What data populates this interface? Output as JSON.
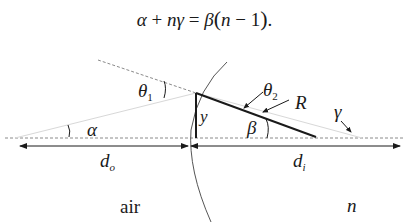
{
  "equation": {
    "text": "α + nγ = β(n − 1).",
    "parts": {
      "alpha": "α",
      "plus": " + ",
      "n1": "n",
      "gamma": "γ",
      "equals": " = ",
      "beta": "β",
      "open": "(",
      "n2": "n",
      "minus": " − ",
      "one": "1",
      "close": ")",
      "period": "."
    }
  },
  "labels": {
    "theta1": "θ",
    "theta1_sub": "1",
    "theta2": "θ",
    "theta2_sub": "2",
    "R": "R",
    "gamma": "γ",
    "alpha": "α",
    "beta": "β",
    "y": "y",
    "do": "d",
    "do_sub": "o",
    "di": "d",
    "di_sub": "i",
    "air": "air",
    "n": "n"
  },
  "colors": {
    "line": "#1a1a1a",
    "dashed": "#8a8a8a",
    "faint_ray": "#d0d0d0"
  }
}
